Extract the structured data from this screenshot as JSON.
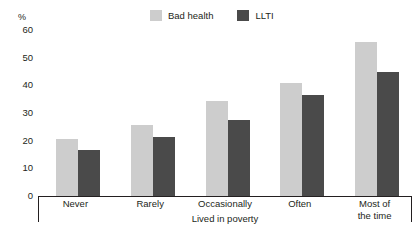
{
  "chart_data": {
    "type": "bar",
    "title": "",
    "xlabel": "Lived in poverty",
    "ylabel": "%",
    "categories": [
      "Never",
      "Rarely",
      "Occasionally",
      "Often",
      "Most of the time"
    ],
    "category_lines": [
      [
        "Never"
      ],
      [
        "Rarely"
      ],
      [
        "Occasionally"
      ],
      [
        "Often"
      ],
      [
        "Most of",
        "the time"
      ]
    ],
    "series": [
      {
        "name": "Bad health",
        "color": "#cdcdcd",
        "values": [
          20.5,
          25.5,
          34.5,
          41,
          55.5
        ]
      },
      {
        "name": "LLTI",
        "color": "#4a4a4a",
        "values": [
          16.5,
          21.5,
          27.5,
          36.5,
          45
        ]
      }
    ],
    "ylim": [
      0,
      60
    ],
    "yticks": [
      "60",
      "50",
      "40",
      "30",
      "20",
      "10",
      "0"
    ],
    "ytick_values": [
      60,
      50,
      40,
      30,
      20,
      10,
      0
    ],
    "grid": false,
    "legend_position": "top-center"
  },
  "legend": {
    "entries": [
      {
        "label": "Bad health",
        "color": "#cdcdcd"
      },
      {
        "label": "LLTI",
        "color": "#4a4a4a"
      }
    ]
  },
  "axis": {
    "unit": "%",
    "x_title": "Lived in poverty"
  },
  "colors": {
    "bad_health": "#cdcdcd",
    "llti": "#4a4a4a",
    "axis": "#231f20",
    "background": "#ffffff"
  }
}
